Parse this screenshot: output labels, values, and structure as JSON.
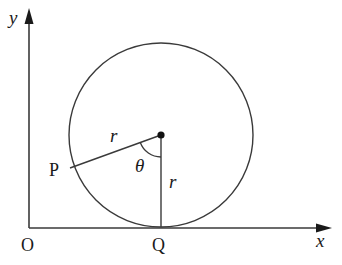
{
  "diagram": {
    "axes": {
      "x_label": "x",
      "y_label": "y",
      "origin_label": "O"
    },
    "points": {
      "P": "P",
      "Q": "Q"
    },
    "segments": {
      "radius_to_P": "r",
      "radius_to_Q": "r"
    },
    "angle": {
      "label": "θ"
    },
    "colors": {
      "stroke": "#3a3a3a",
      "text": "#1a1a1a",
      "background": "#ffffff"
    }
  }
}
